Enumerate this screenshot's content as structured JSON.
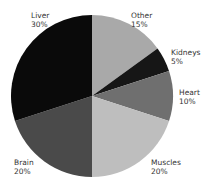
{
  "chart_data": {
    "type": "pie",
    "title": "",
    "slices": [
      {
        "label": "Other",
        "value": 15,
        "pct_label": "15%",
        "color": "#a9a9a9"
      },
      {
        "label": "Kidneys",
        "value": 5,
        "pct_label": "5%",
        "color": "#161616"
      },
      {
        "label": "Heart",
        "value": 10,
        "pct_label": "10%",
        "color": "#6f6f6f"
      },
      {
        "label": "Muscles",
        "value": 20,
        "pct_label": "20%",
        "color": "#bebebe"
      },
      {
        "label": "Brain",
        "value": 20,
        "pct_label": "20%",
        "color": "#4a4a4a"
      },
      {
        "label": "Liver",
        "value": 30,
        "pct_label": "30%",
        "color": "#0a0a0a"
      }
    ],
    "start_angle_deg": 0,
    "direction": "clockwise",
    "legend": "none (labels placed outside slices)"
  }
}
